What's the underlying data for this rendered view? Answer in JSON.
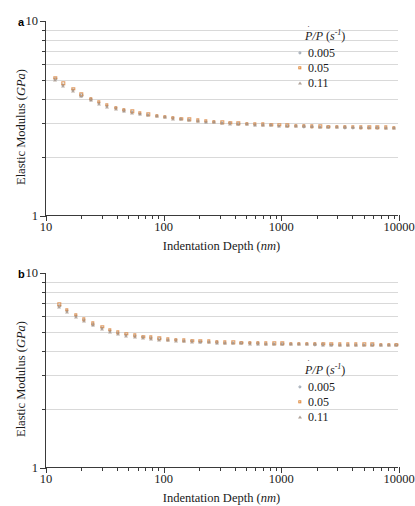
{
  "figure": {
    "panels": [
      {
        "label": "a",
        "legend": {
          "title": "Ṗ/P (s⁻¹)",
          "title_parts": {
            "p_dot": "Ṗ",
            "slash": "/",
            "p": "P",
            "units": "(s-1)"
          },
          "position": "top-right",
          "entries": [
            {
              "value": "0.005",
              "marker": "circle",
              "color": "#7d8a98"
            },
            {
              "value": "0.05",
              "marker": "square",
              "color": "#d8823c"
            },
            {
              "value": "0.11",
              "marker": "triangle",
              "color": "#a8968a"
            }
          ]
        }
      },
      {
        "label": "b",
        "legend": {
          "title": "Ṗ/P (s⁻¹)",
          "position": "bottom-right",
          "entries": [
            {
              "value": "0.005",
              "marker": "circle",
              "color": "#7d8a98"
            },
            {
              "value": "0.05",
              "marker": "square",
              "color": "#d8823c"
            },
            {
              "value": "0.11",
              "marker": "triangle",
              "color": "#a8968a"
            }
          ]
        }
      }
    ],
    "axis_titles": {
      "x_main": "Indentation Depth",
      "x_units": "nm",
      "y_main": "Elastic Modulus",
      "y_units": "GPa"
    },
    "ticks": {
      "x_major": [
        "10",
        "100",
        "1000",
        "10000"
      ],
      "y_major": [
        "10",
        "1"
      ]
    },
    "colors": {
      "grid": "#d9d9d9",
      "axis": "#3a3a3a",
      "series_1": "#7d8a98",
      "series_2": "#d8823c",
      "series_3": "#a8968a",
      "background": "#ffffff"
    }
  },
  "chart_data": [
    {
      "type": "scatter",
      "panel": "a",
      "title": "",
      "xlabel": "Indentation Depth (nm)",
      "ylabel": "Elastic Modulus (GPa)",
      "xscale": "log",
      "yscale": "log",
      "xlim": [
        10,
        10000
      ],
      "ylim": [
        1,
        10
      ],
      "xticks": [
        10,
        100,
        1000,
        10000
      ],
      "yticks": [
        1,
        10
      ],
      "y_minor_gridlines": [
        2,
        3,
        4,
        5,
        6,
        7,
        8,
        9
      ],
      "grid": true,
      "legend_position": "top-right",
      "series": [
        {
          "name": "0.005",
          "marker": "circle",
          "color": "#7d8a98",
          "x": [
            12,
            14,
            17,
            20,
            24,
            28,
            33,
            39,
            46,
            54,
            63,
            74,
            87,
            102,
            120,
            141,
            165,
            194,
            228,
            267,
            314,
            368,
            432,
            507,
            595,
            698,
            819,
            961,
            1128,
            1323,
            1553,
            1822,
            2138,
            2509,
            2944,
            3455,
            4054,
            4757,
            5582,
            6550,
            7686,
            9020
          ],
          "y": [
            5.05,
            4.72,
            4.42,
            4.15,
            3.96,
            3.8,
            3.67,
            3.57,
            3.48,
            3.41,
            3.35,
            3.3,
            3.25,
            3.21,
            3.17,
            3.14,
            3.11,
            3.08,
            3.05,
            3.03,
            3.01,
            2.99,
            2.97,
            2.96,
            2.94,
            2.93,
            2.92,
            2.91,
            2.9,
            2.89,
            2.88,
            2.87,
            2.86,
            2.855,
            2.85,
            2.845,
            2.84,
            2.835,
            2.83,
            2.828,
            2.825,
            2.82
          ]
        },
        {
          "name": "0.05",
          "marker": "square",
          "color": "#d8823c",
          "x": [
            12,
            14,
            17,
            20,
            24,
            28,
            33,
            39,
            46,
            54,
            63,
            74,
            87,
            102,
            120,
            141,
            165,
            194,
            228,
            267,
            314,
            368,
            432,
            507,
            595,
            698,
            819,
            961,
            1128,
            1323,
            1553,
            1822,
            2138,
            2509,
            2944,
            3455,
            4054,
            4757,
            5582,
            6550,
            7686,
            9020
          ],
          "y": [
            5.12,
            4.8,
            4.48,
            4.2,
            4.0,
            3.84,
            3.71,
            3.6,
            3.51,
            3.44,
            3.38,
            3.32,
            3.27,
            3.23,
            3.19,
            3.16,
            3.13,
            3.1,
            3.07,
            3.05,
            3.03,
            3.01,
            2.99,
            2.97,
            2.96,
            2.95,
            2.94,
            2.93,
            2.92,
            2.91,
            2.9,
            2.89,
            2.88,
            2.875,
            2.87,
            2.865,
            2.86,
            2.855,
            2.85,
            2.848,
            2.845,
            2.84
          ]
        },
        {
          "name": "0.11",
          "marker": "triangle",
          "color": "#a8968a",
          "x": [
            12,
            14,
            17,
            20,
            24,
            28,
            33,
            39,
            46,
            54,
            63,
            74,
            87,
            102,
            120,
            141,
            165,
            194,
            228,
            267,
            314,
            368,
            432,
            507,
            595,
            698,
            819,
            961,
            1128,
            1323,
            1553,
            1822,
            2138,
            2509,
            2944,
            3455,
            4054,
            4757,
            5582,
            6550,
            7686,
            9020
          ],
          "y": [
            4.98,
            4.66,
            4.37,
            4.11,
            3.92,
            3.77,
            3.64,
            3.54,
            3.46,
            3.39,
            3.33,
            3.28,
            3.24,
            3.2,
            3.16,
            3.13,
            3.1,
            3.07,
            3.04,
            3.02,
            3.0,
            2.98,
            2.965,
            2.95,
            2.94,
            2.93,
            2.92,
            2.91,
            2.9,
            2.89,
            2.885,
            2.88,
            2.875,
            2.87,
            2.865,
            2.86,
            2.855,
            2.85,
            2.848,
            2.845,
            2.842,
            2.84
          ]
        }
      ]
    },
    {
      "type": "scatter",
      "panel": "b",
      "title": "",
      "xlabel": "Indentation Depth (nm)",
      "ylabel": "Elastic Modulus (GPa)",
      "xscale": "log",
      "yscale": "log",
      "xlim": [
        10,
        10000
      ],
      "ylim": [
        1,
        10
      ],
      "xticks": [
        10,
        100,
        1000,
        10000
      ],
      "yticks": [
        1,
        10
      ],
      "y_minor_gridlines": [
        2,
        3,
        4,
        5,
        6,
        7,
        8,
        9
      ],
      "grid": true,
      "legend_position": "bottom-right",
      "series": [
        {
          "name": "0.005",
          "marker": "circle",
          "color": "#7d8a98",
          "x": [
            13,
            15,
            18,
            21,
            25,
            30,
            35,
            41,
            48,
            57,
            67,
            78,
            92,
            108,
            127,
            149,
            175,
            205,
            241,
            283,
            332,
            390,
            458,
            537,
            631,
            740,
            869,
            1020,
            1197,
            1405,
            1649,
            1935,
            2271,
            2665,
            3128,
            3671,
            4308,
            5056,
            5934,
            6964,
            8173,
            9500
          ],
          "y": [
            6.78,
            6.38,
            6.05,
            5.72,
            5.45,
            5.22,
            5.05,
            4.92,
            4.82,
            4.74,
            4.68,
            4.63,
            4.59,
            4.55,
            4.52,
            4.49,
            4.47,
            4.45,
            4.43,
            4.41,
            4.4,
            4.38,
            4.37,
            4.36,
            4.35,
            4.34,
            4.33,
            4.325,
            4.32,
            4.315,
            4.31,
            4.305,
            4.3,
            4.298,
            4.295,
            4.292,
            4.29,
            4.288,
            4.285,
            4.283,
            4.28,
            4.278
          ]
        },
        {
          "name": "0.05",
          "marker": "square",
          "color": "#d8823c",
          "x": [
            13,
            15,
            18,
            21,
            25,
            30,
            35,
            41,
            48,
            57,
            67,
            78,
            92,
            108,
            127,
            149,
            175,
            205,
            241,
            283,
            332,
            390,
            458,
            537,
            631,
            740,
            869,
            1020,
            1197,
            1405,
            1649,
            1935,
            2271,
            2665,
            3128,
            3671,
            4308,
            5056,
            5934,
            6964,
            8173,
            9500
          ],
          "y": [
            6.9,
            6.48,
            6.12,
            5.8,
            5.52,
            5.28,
            5.1,
            4.97,
            4.87,
            4.79,
            4.72,
            4.67,
            4.62,
            4.58,
            4.55,
            4.52,
            4.5,
            4.48,
            4.46,
            4.44,
            4.42,
            4.41,
            4.4,
            4.38,
            4.37,
            4.36,
            4.355,
            4.35,
            4.345,
            4.34,
            4.335,
            4.33,
            4.325,
            4.32,
            4.315,
            4.312,
            4.31,
            4.305,
            4.3,
            4.298,
            4.295,
            4.292
          ]
        },
        {
          "name": "0.11",
          "marker": "triangle",
          "color": "#a8968a",
          "x": [
            13,
            15,
            18,
            21,
            25,
            30,
            35,
            41,
            48,
            57,
            67,
            78,
            92,
            108,
            127,
            149,
            175,
            205,
            241,
            283,
            332,
            390,
            458,
            537,
            631,
            740,
            869,
            1020,
            1197,
            1405,
            1649,
            1935,
            2271,
            2665,
            3128,
            3671,
            4308,
            5056,
            5934,
            6964,
            8173,
            9500
          ],
          "y": [
            6.7,
            6.3,
            5.98,
            5.66,
            5.4,
            5.17,
            5.0,
            4.88,
            4.78,
            4.7,
            4.65,
            4.6,
            4.56,
            4.52,
            4.49,
            4.47,
            4.45,
            4.43,
            4.41,
            4.39,
            4.38,
            4.37,
            4.355,
            4.345,
            4.34,
            4.33,
            4.325,
            4.32,
            4.315,
            4.31,
            4.305,
            4.3,
            4.298,
            4.295,
            4.292,
            4.29,
            4.288,
            4.285,
            4.283,
            4.28,
            4.278,
            4.275
          ]
        }
      ]
    }
  ]
}
